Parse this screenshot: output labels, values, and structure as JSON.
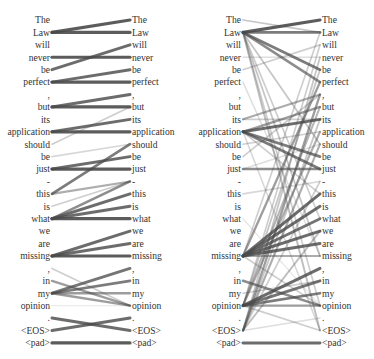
{
  "figure": {
    "type": "attention-alignment",
    "row_start_y": 20,
    "row_spacing": 12.42,
    "line_color": "#4a4a4a"
  },
  "tokens": [
    "The",
    "Law",
    "will",
    "never",
    "be",
    "perfect",
    ",",
    "but",
    "its",
    "application",
    "should",
    "be",
    "just",
    "-",
    "this",
    "is",
    "what",
    "we",
    "are",
    "missing",
    ",",
    "in",
    "my",
    "opinion",
    ".",
    "<EOS>",
    "<pad>"
  ],
  "panels": [
    {
      "id": "left",
      "left_label_x": 50,
      "right_label_x": 132,
      "line_x1": 52,
      "line_x2": 130,
      "edges": [
        [
          1,
          0,
          1.0
        ],
        [
          1,
          1,
          1.0
        ],
        [
          3,
          3,
          1.0
        ],
        [
          4,
          2,
          0.9
        ],
        [
          5,
          4,
          0.9
        ],
        [
          5,
          5,
          1.0
        ],
        [
          7,
          6,
          0.9
        ],
        [
          7,
          7,
          1.0
        ],
        [
          10,
          7,
          0.3
        ],
        [
          9,
          8,
          0.9
        ],
        [
          9,
          9,
          1.0
        ],
        [
          11,
          10,
          0.25
        ],
        [
          12,
          11,
          0.9
        ],
        [
          12,
          12,
          1.0
        ],
        [
          14,
          10,
          0.8
        ],
        [
          14,
          13,
          0.5
        ],
        [
          15,
          13,
          0.3
        ],
        [
          16,
          13,
          0.7
        ],
        [
          16,
          14,
          0.9
        ],
        [
          16,
          15,
          0.9
        ],
        [
          16,
          16,
          1.0
        ],
        [
          19,
          17,
          0.9
        ],
        [
          19,
          18,
          0.9
        ],
        [
          19,
          19,
          1.0
        ],
        [
          20,
          23,
          0.3
        ],
        [
          21,
          23,
          0.6
        ],
        [
          22,
          20,
          0.85
        ],
        [
          22,
          21,
          0.8
        ],
        [
          22,
          22,
          0.6
        ],
        [
          22,
          23,
          0.6
        ],
        [
          23,
          23,
          0.12
        ],
        [
          24,
          25,
          0.9
        ],
        [
          25,
          24,
          0.9
        ],
        [
          26,
          26,
          1.0
        ]
      ]
    },
    {
      "id": "right",
      "left_label_x": 53,
      "right_label_x": 134,
      "line_x1": 55,
      "line_x2": 132,
      "edges": [
        [
          0,
          1,
          0.35
        ],
        [
          1,
          0,
          1.0
        ],
        [
          1,
          1,
          0.8
        ],
        [
          1,
          4,
          0.8
        ],
        [
          1,
          5,
          0.7
        ],
        [
          1,
          10,
          0.35
        ],
        [
          1,
          16,
          0.3
        ],
        [
          1,
          19,
          0.35
        ],
        [
          1,
          23,
          0.3
        ],
        [
          1,
          25,
          0.4
        ],
        [
          3,
          3,
          0.2
        ],
        [
          4,
          2,
          0.3
        ],
        [
          5,
          19,
          0.2
        ],
        [
          8,
          6,
          0.5
        ],
        [
          8,
          8,
          0.3
        ],
        [
          9,
          7,
          0.6
        ],
        [
          9,
          8,
          0.9
        ],
        [
          9,
          11,
          0.8
        ],
        [
          9,
          12,
          0.8
        ],
        [
          9,
          25,
          0.25
        ],
        [
          9,
          14,
          0.3
        ],
        [
          10,
          9,
          0.3
        ],
        [
          11,
          6,
          0.3
        ],
        [
          12,
          12,
          0.7
        ],
        [
          12,
          10,
          0.2
        ],
        [
          14,
          13,
          0.25
        ],
        [
          16,
          23,
          0.15
        ],
        [
          19,
          14,
          0.9
        ],
        [
          19,
          15,
          0.9
        ],
        [
          19,
          16,
          0.85
        ],
        [
          19,
          17,
          0.9
        ],
        [
          19,
          18,
          0.9
        ],
        [
          19,
          19,
          0.5
        ],
        [
          19,
          5,
          0.6
        ],
        [
          19,
          1,
          0.3
        ],
        [
          19,
          23,
          0.3
        ],
        [
          21,
          23,
          0.7
        ],
        [
          22,
          21,
          0.3
        ],
        [
          23,
          20,
          0.9
        ],
        [
          23,
          21,
          0.85
        ],
        [
          23,
          22,
          0.8
        ],
        [
          23,
          23,
          0.6
        ],
        [
          23,
          4,
          0.35
        ],
        [
          23,
          7,
          0.45
        ],
        [
          23,
          9,
          0.5
        ],
        [
          23,
          25,
          0.3
        ],
        [
          23,
          2,
          0.3
        ],
        [
          25,
          3,
          0.35
        ],
        [
          25,
          6,
          0.6
        ],
        [
          25,
          10,
          0.5
        ],
        [
          25,
          24,
          0.2
        ],
        [
          25,
          8,
          0.35
        ],
        [
          25,
          13,
          0.3
        ],
        [
          25,
          17,
          0.4
        ],
        [
          26,
          26,
          0.9
        ]
      ]
    }
  ]
}
